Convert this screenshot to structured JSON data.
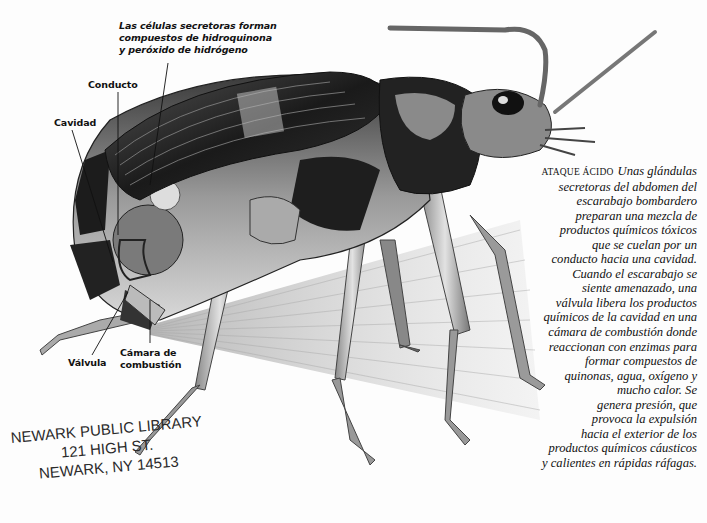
{
  "figure": {
    "labels": {
      "secretory_cells": [
        "Las células secretoras forman",
        "compuestos de hidroquinona",
        "y peróxido de hidrógeno"
      ],
      "conduct": "Conducto",
      "cavity": "Cavidad",
      "valve": "Válvula",
      "combustion_chamber": [
        "Cámara de",
        "combustión"
      ]
    }
  },
  "caption": {
    "heading": "ATAQUE ÁCIDO",
    "lines": [
      "Unas glándulas",
      "secretoras del abdomen del",
      "escarabajo bombardero",
      "preparan una mezcla de",
      "productos químicos tóxicos",
      "que se cuelan por un",
      "conducto hacia una cavidad.",
      "Cuando el escarabajo se",
      "siente amenazado, una",
      "válvula libera los productos",
      "químicos de la cavidad en una",
      "cámara de combustión donde",
      "reaccionan con enzimas para",
      "formar compuestos de",
      "quinonas, agua, oxígeno y",
      "mucho calor. Se",
      "genera presión, que",
      "provoca la expulsión",
      "hacia el exterior de los",
      "productos químicos cáusticos",
      "y calientes en rápidas ráfagas."
    ]
  },
  "stamp": {
    "lines": [
      "NEWARK PUBLIC LIBRARY",
      "121 HIGH ST.",
      "NEWARK, NY  14513"
    ]
  }
}
